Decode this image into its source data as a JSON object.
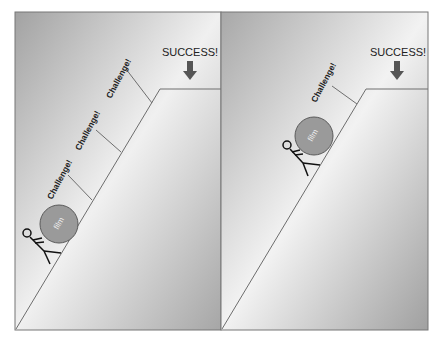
{
  "panels": [
    {
      "id": "left",
      "success_label": "SUCCESS!",
      "ball_label": "film",
      "challenges": [
        "Challenge!",
        "Challenge!",
        "Challenge!"
      ]
    },
    {
      "id": "right",
      "success_label": "SUCCESS!",
      "ball_label": "film",
      "challenges": [
        "Challenge!"
      ]
    }
  ],
  "colors": {
    "panel_bg_dark": "#a9a9a9",
    "panel_bg_light": "#f2f2f2",
    "line": "#6e6e6e",
    "ball_fill": "#9a9a9a",
    "ball_stroke": "#5a5a5a",
    "arrow": "#555555",
    "text": "#222222"
  }
}
